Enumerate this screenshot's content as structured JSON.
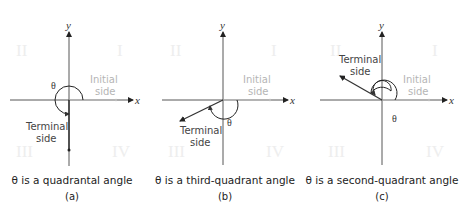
{
  "panels": [
    {
      "id": "a",
      "axis_x": "x",
      "axis_y": "y",
      "quadrants": [
        "I",
        "II",
        "III",
        "IV"
      ],
      "initial_side": [
        "Initial",
        "side"
      ],
      "terminal_side": [
        "Terminal",
        "side"
      ],
      "theta": "θ",
      "caption": "θ is a quadrantal angle",
      "sublabel": "(a)"
    },
    {
      "id": "b",
      "axis_x": "x",
      "axis_y": "y",
      "quadrants": [
        "I",
        "II",
        "III",
        "IV"
      ],
      "initial_side": [
        "Initial",
        "side"
      ],
      "terminal_side": [
        "Terminal",
        "side"
      ],
      "theta": "θ",
      "caption": "θ is a third-quadrant angle",
      "sublabel": "(b)"
    },
    {
      "id": "c",
      "axis_x": "x",
      "axis_y": "y",
      "quadrants": [
        "I",
        "II",
        "III",
        "IV"
      ],
      "initial_side": [
        "Initial",
        "side"
      ],
      "terminal_side": [
        "Terminal",
        "side"
      ],
      "theta": "θ",
      "caption": "θ is a second-quadrant angle",
      "sublabel": "(c)"
    }
  ]
}
